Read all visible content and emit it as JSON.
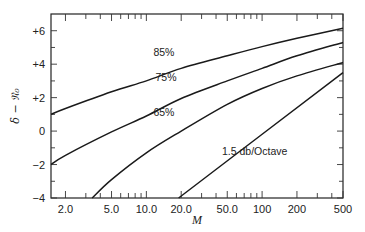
{
  "chart_data": {
    "type": "line",
    "title": "",
    "xlabel": "M",
    "ylabel": "δ − 𝔑₀",
    "xscale": "log",
    "xlim": [
      1.5,
      500
    ],
    "ylim": [
      -4,
      7
    ],
    "grid": false,
    "legend": "none (inline curve annotations)",
    "x_ticks": [
      2,
      3,
      4,
      5,
      6,
      7,
      8,
      9,
      10,
      20,
      30,
      40,
      50,
      60,
      70,
      80,
      90,
      100,
      200,
      300,
      400,
      500
    ],
    "x_tick_labels": [
      {
        "value": 2,
        "label": "2.0"
      },
      {
        "value": 5,
        "label": "5.0"
      },
      {
        "value": 10,
        "label": "10.0"
      },
      {
        "value": 20,
        "label": "20.0"
      },
      {
        "value": 50,
        "label": "50.0"
      },
      {
        "value": 100,
        "label": "100"
      },
      {
        "value": 200,
        "label": "200"
      },
      {
        "value": 500,
        "label": "500"
      }
    ],
    "y_ticks": [
      -4,
      -3,
      -2,
      -1,
      0,
      1,
      2,
      3,
      4,
      5,
      6
    ],
    "y_tick_labels": [
      {
        "value": 6,
        "label": "+6"
      },
      {
        "value": 4,
        "label": "+4"
      },
      {
        "value": 2,
        "label": "+2"
      },
      {
        "value": 0,
        "label": "0"
      },
      {
        "value": -2,
        "label": "−2"
      },
      {
        "value": -4,
        "label": "−4"
      }
    ],
    "series": [
      {
        "name": "85%",
        "x": [
          1.5,
          2,
          5,
          10,
          20,
          50,
          100,
          200,
          500
        ],
        "y": [
          1.0,
          1.35,
          2.35,
          3.0,
          3.75,
          4.5,
          5.05,
          5.55,
          6.15
        ],
        "label_pos": {
          "x": 11.5,
          "y": 4.5
        }
      },
      {
        "name": "75%",
        "x": [
          1.5,
          2,
          5,
          10,
          20,
          50,
          100,
          200,
          500
        ],
        "y": [
          -2.0,
          -1.45,
          -0.05,
          0.9,
          1.95,
          3.0,
          3.75,
          4.5,
          5.3
        ],
        "label_pos": {
          "x": 12.0,
          "y": 3.0
        }
      },
      {
        "name": "65%",
        "x": [
          3.4,
          5,
          10,
          20,
          50,
          100,
          200,
          500
        ],
        "y": [
          -4.0,
          -2.9,
          -1.3,
          0.0,
          1.6,
          2.55,
          3.3,
          4.1
        ],
        "label_pos": {
          "x": 11.5,
          "y": 0.9
        }
      },
      {
        "name": "1.5 db/Octave",
        "x": [
          19,
          500
        ],
        "y": [
          -4.0,
          3.5
        ],
        "label_pos": {
          "x": 45,
          "y": -1.4
        }
      }
    ]
  }
}
